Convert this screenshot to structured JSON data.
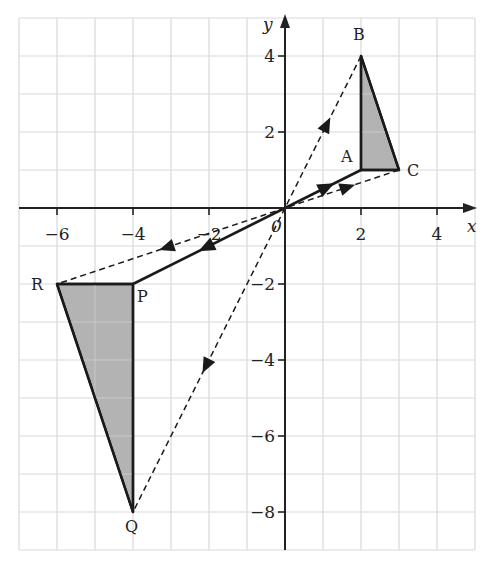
{
  "figure": {
    "type": "coordinate-grid-enlargement",
    "x_axis": {
      "label": "x",
      "min": -7,
      "max": 5,
      "ticks": [
        -6,
        -4,
        -2,
        2,
        4
      ],
      "tick_labels": [
        "−6",
        "−4",
        "−2",
        "2",
        "4"
      ]
    },
    "y_axis": {
      "label": "y",
      "min": -9,
      "max": 5,
      "ticks": [
        4,
        2,
        -2,
        -4,
        -6,
        -8
      ],
      "tick_labels": [
        "4",
        "2",
        "−2",
        "−4",
        "−6",
        "−8"
      ]
    },
    "origin_label": "0",
    "object_triangle": {
      "vertices": [
        {
          "name": "A",
          "x": 2,
          "y": 1
        },
        {
          "name": "B",
          "x": 2,
          "y": 4
        },
        {
          "name": "C",
          "x": 3,
          "y": 1
        }
      ],
      "fill": "#b3b3b3"
    },
    "image_triangle": {
      "vertices": [
        {
          "name": "P",
          "x": -4,
          "y": -2
        },
        {
          "name": "Q",
          "x": -4,
          "y": -8
        },
        {
          "name": "R",
          "x": -6,
          "y": -2
        }
      ],
      "fill": "#b3b3b3"
    },
    "rays": [
      {
        "from": "A",
        "to": "P",
        "style": "solid"
      },
      {
        "from": "B",
        "to": "Q",
        "style": "dashed"
      },
      {
        "from": "C",
        "to": "R",
        "style": "dashed"
      }
    ],
    "scale_factor_shown": null,
    "colors": {
      "grid": "#d9d9d9",
      "axis": "#222222",
      "shape_fill": "#b3b3b3",
      "stroke": "#1a1a1a"
    }
  }
}
